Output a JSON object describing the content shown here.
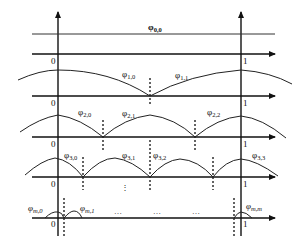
{
  "diagram": {
    "type": "hierarchical basis functions",
    "levels": [
      {
        "level": 0,
        "function_labels": [
          "φ0,0"
        ],
        "label_text": [
          "φ",
          "0,0"
        ]
      },
      {
        "level": 1,
        "function_labels": [
          "φ1,0",
          "φ1,1"
        ]
      },
      {
        "level": 2,
        "function_labels": [
          "φ2,0",
          "φ2,1",
          "φ2,2"
        ]
      },
      {
        "level": 3,
        "function_labels": [
          "φ3,0",
          "φ3,1",
          "φ3,2",
          "φ3,3"
        ]
      },
      {
        "level": "m",
        "function_labels": [
          "φm,0",
          "φm,1",
          "φm,m"
        ]
      }
    ],
    "axis_ticks": {
      "left": "0",
      "right": "1"
    },
    "ellipsis_vertical": "⋮",
    "ellipsis_horizontal": "…"
  },
  "labels": {
    "phi": "φ",
    "l00": "0,0",
    "l10": "1,0",
    "l11": "1,1",
    "l20": "2,0",
    "l21": "2,1",
    "l22": "2,2",
    "l30": "3,0",
    "l31": "3,1",
    "l32": "3,2",
    "l33": "3,3",
    "lm0": "m,0",
    "lm1": "m,1",
    "lmm": "m,m",
    "zero": "0",
    "one": "1",
    "vdots": "⋮",
    "hdots": "…"
  }
}
